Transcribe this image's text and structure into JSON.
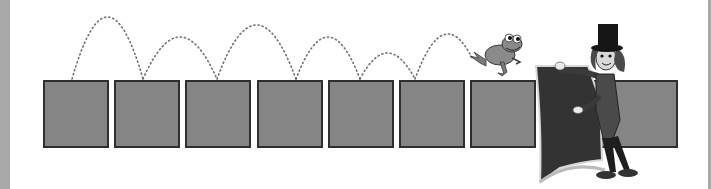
{
  "scene": {
    "description": "Frog hopping along a row of squares toward a magician holding a cape",
    "colors": {
      "background": "#ffffff",
      "edge": "#a9a9a9",
      "square_fill": "#858585",
      "square_border": "#2e2e2e",
      "dots": "#707070",
      "frog": "#8a8a8a",
      "magician_dark": "#2a2a2a",
      "cape": "#3a3a3a"
    },
    "squares": [
      {
        "index": 1,
        "x": 43
      },
      {
        "index": 2,
        "x": 114
      },
      {
        "index": 3,
        "x": 185
      },
      {
        "index": 4,
        "x": 257
      },
      {
        "index": 5,
        "x": 328
      },
      {
        "index": 6,
        "x": 399
      },
      {
        "index": 7,
        "x": 470
      },
      {
        "index": 8,
        "x": 541,
        "hidden_by_cape": true
      },
      {
        "index": 9,
        "x": 612
      }
    ],
    "hops": [
      {
        "from": 72,
        "to": 143,
        "peak_y": 17
      },
      {
        "from": 143,
        "to": 217,
        "peak_y": 37
      },
      {
        "from": 217,
        "to": 296,
        "peak_y": 25
      },
      {
        "from": 296,
        "to": 360,
        "peak_y": 37
      },
      {
        "from": 360,
        "to": 415,
        "peak_y": 53
      },
      {
        "from": 415,
        "to": 472,
        "peak_y": 40
      }
    ],
    "characters": [
      "frog-icon",
      "magician-icon"
    ]
  }
}
